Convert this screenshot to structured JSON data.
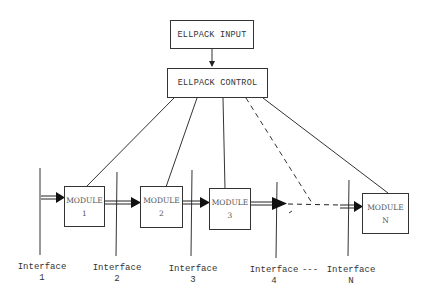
{
  "diagram": {
    "input_box": {
      "label": "ELLPACK INPUT"
    },
    "control_box": {
      "label": "ELLPACK CONTROL"
    },
    "modules": [
      {
        "label": "MODULE",
        "index": "1"
      },
      {
        "label": "MODULE",
        "index": "2"
      },
      {
        "label": "MODULE",
        "index": "3"
      },
      {
        "label": "MODULE",
        "index": "N"
      }
    ],
    "interfaces": [
      {
        "label": "Interface",
        "index": "1"
      },
      {
        "label": "Interface",
        "index": "2"
      },
      {
        "label": "Interface",
        "index": "3"
      },
      {
        "label": "Interface",
        "index": "4"
      },
      {
        "label": "Interface",
        "index": "N"
      }
    ],
    "interface_ellipsis": "---",
    "colors": {
      "line": "#333333",
      "background": "#ffffff"
    }
  }
}
